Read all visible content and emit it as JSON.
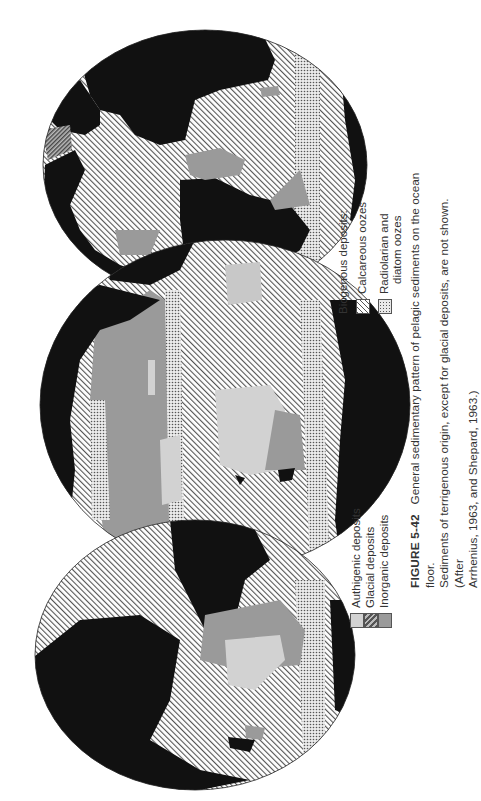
{
  "figure": {
    "label": "FIGURE 5-42",
    "caption_line1": "General sedimentary pattern of pelagic sediments on the ocean floor.",
    "caption_line2": "Sediments of terrigenous origin, except for glacial deposits, are not shown. (After",
    "caption_line3": "Arrhenius, 1963, and Shepard, 1963.)"
  },
  "legend_left": {
    "items": [
      {
        "label": "Authigenic deposits",
        "swatch": "light-gray-fill",
        "color": "#d2d2d2"
      },
      {
        "label": "Glacial deposits",
        "swatch": "dense-diagonal-hatch",
        "color": "#555555"
      },
      {
        "label": "Inorganic deposits",
        "swatch": "medium-gray-fill",
        "color": "#9a9a9a"
      }
    ]
  },
  "legend_right": {
    "title": "Biogenous deposits:",
    "items": [
      {
        "label": "Calcareous oozes",
        "swatch": "diagonal-hatch",
        "color": "#555555"
      },
      {
        "label_line1": "Radiolarian and",
        "label_line2": "diatom oozes",
        "swatch": "stipple-dots",
        "color": "#555555"
      }
    ]
  },
  "map": {
    "projection": "interrupted (three lobes), rotated 90 degrees",
    "land_color": "#111111",
    "ocean_bg": "#ffffff",
    "lobes": [
      "top-lobe",
      "middle-lobe",
      "bottom-lobe"
    ]
  }
}
